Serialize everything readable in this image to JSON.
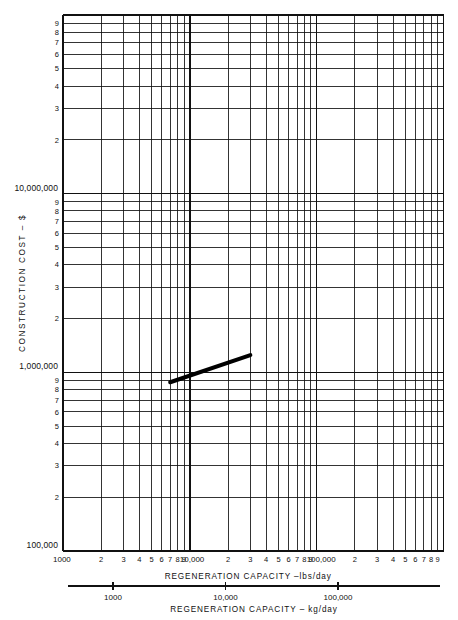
{
  "figure": {
    "type": "log-log-chart",
    "background": "#ffffff",
    "ink": "#111111"
  },
  "axes": {
    "y_title": "CONSTRUCTION  COST – $",
    "x_title_primary": "REGENERATION   CAPACITY –lbs/day",
    "x_title_secondary": "REGENERATION   CAPACITY – kg/day"
  },
  "chart_data": {
    "type": "line",
    "title": "",
    "xlabel": "REGENERATION   CAPACITY –lbs/day",
    "ylabel": "CONSTRUCTION  COST – $",
    "xscale": "log",
    "yscale": "log",
    "xlim": [
      1000,
      1000000
    ],
    "ylim": [
      100000,
      100000000
    ],
    "grid": true,
    "legend": "none",
    "x_major_labels": [
      "1000",
      "10,000",
      "100,000"
    ],
    "x_minor_labels": [
      "2",
      "3",
      "4",
      "5",
      "6",
      "7",
      "8",
      "9"
    ],
    "y_major_labels": [
      "100,000",
      "1,000,000",
      "10,000,000"
    ],
    "y_minor_labels": [
      "2",
      "3",
      "4",
      "5",
      "6",
      "7",
      "8",
      "9"
    ],
    "secondary_x_axis": {
      "label": "REGENERATION   CAPACITY – kg/day",
      "ticks": [
        "1000",
        "10,000",
        "100,000"
      ],
      "tick_values": [
        1000,
        10000,
        100000
      ]
    },
    "series": [
      {
        "name": "construction cost",
        "style": "solid-thick",
        "color": "#000000",
        "points": [
          {
            "x": 7000,
            "y": 880000
          },
          {
            "x": 30000,
            "y": 1250000
          }
        ]
      }
    ]
  }
}
